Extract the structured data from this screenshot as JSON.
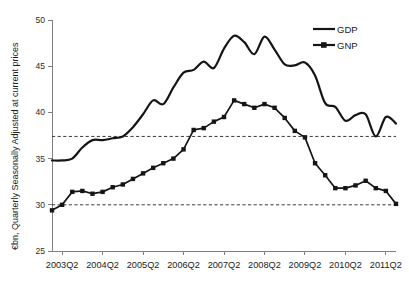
{
  "chart_data": {
    "type": "line",
    "title": "",
    "xlabel": "",
    "ylabel": "€bn, Quarterly Seasonally Adjusted at current prices",
    "ylim": [
      25,
      50
    ],
    "yticks": [
      25,
      30,
      35,
      40,
      45,
      50
    ],
    "grid": false,
    "legend_position": "top-right",
    "x_tick_labels": [
      "2003Q2",
      "2004Q2",
      "2005Q2",
      "2006Q2",
      "2007Q2",
      "2008Q2",
      "2009Q2",
      "2010Q2",
      "2011Q2"
    ],
    "x": [
      "2003Q1",
      "2003Q2",
      "2003Q3",
      "2003Q4",
      "2004Q1",
      "2004Q2",
      "2004Q3",
      "2004Q4",
      "2005Q1",
      "2005Q2",
      "2005Q3",
      "2005Q4",
      "2006Q1",
      "2006Q2",
      "2006Q3",
      "2006Q4",
      "2007Q1",
      "2007Q2",
      "2007Q3",
      "2007Q4",
      "2008Q1",
      "2008Q2",
      "2008Q3",
      "2008Q4",
      "2009Q1",
      "2009Q2",
      "2009Q3",
      "2009Q4",
      "2010Q1",
      "2010Q2",
      "2010Q3",
      "2010Q4",
      "2011Q1",
      "2011Q2",
      "2011Q3"
    ],
    "series": [
      {
        "name": "GDP",
        "marker": "none",
        "values": [
          34.8,
          34.8,
          35.0,
          36.2,
          37.0,
          37.0,
          37.2,
          37.4,
          38.4,
          39.8,
          41.3,
          40.9,
          42.7,
          44.3,
          44.6,
          45.5,
          44.8,
          46.9,
          48.3,
          47.6,
          46.3,
          48.2,
          46.8,
          45.2,
          45.1,
          45.4,
          44.0,
          41.0,
          40.6,
          39.1,
          39.7,
          39.8,
          37.4,
          39.5,
          38.8
        ]
      },
      {
        "name": "GNP",
        "marker": "square",
        "values": [
          29.4,
          30.0,
          31.4,
          31.5,
          31.2,
          31.4,
          31.9,
          32.2,
          32.8,
          33.4,
          34.0,
          34.5,
          35.0,
          36.0,
          38.1,
          38.3,
          39.0,
          39.5,
          41.3,
          40.9,
          40.5,
          40.9,
          40.5,
          39.4,
          38.0,
          37.3,
          34.5,
          33.2,
          31.8,
          31.8,
          32.1,
          32.6,
          31.8,
          31.5,
          30.1
        ]
      }
    ],
    "reference_lines": [
      {
        "name": "upper-reference",
        "value": 37.4,
        "style": "dashed"
      },
      {
        "name": "lower-reference",
        "value": 30.0,
        "style": "dashed"
      }
    ],
    "legend": [
      {
        "label": "GDP",
        "marker": "none"
      },
      {
        "label": "GNP",
        "marker": "square"
      }
    ],
    "colors": {
      "series": "#151515",
      "axis": "#808080",
      "reference": "#3c3c3c"
    }
  }
}
